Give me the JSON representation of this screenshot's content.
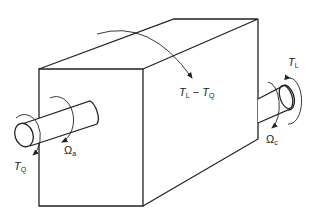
{
  "diagram": {
    "title": "",
    "labels": {
      "torque_input": {
        "symbol": "T",
        "subscript": "Q"
      },
      "torque_output": {
        "symbol": "T",
        "subscript": "L"
      },
      "reaction_torque": {
        "symbol_a": "T",
        "sub_a": "L",
        "op": " − ",
        "symbol_b": "T",
        "sub_b": "Q"
      },
      "omega_input": {
        "symbol": "Ω",
        "subscript": "a"
      },
      "omega_output": {
        "symbol": "Ω",
        "subscript": "c"
      }
    },
    "colors": {
      "stroke": "#222222",
      "background": "#ffffff"
    }
  }
}
